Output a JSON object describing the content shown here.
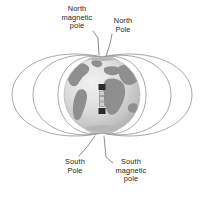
{
  "figure": {
    "background_color": "#ffffff"
  },
  "labels": {
    "north_magnetic_pole": "North\nmagnetic\npole",
    "north_pole": "North\nPole",
    "south_pole": "South\nPole",
    "south_magnetic_pole": "South\nmagnetic\npole"
  },
  "colors": {
    "text": "#1d1d1d",
    "field_line": "#9a9a9a",
    "leader_line": "#6f6f6f",
    "globe_ocean_light": "#e8e8e8",
    "globe_ocean_mid": "#cfcfcf",
    "globe_ocean_dark": "#a8a8a8",
    "globe_land": "#8f8f8f",
    "globe_outline": "#bdbdbd",
    "magnet_dark": "#2b2b2b",
    "magnet_light": "#d8d8d8"
  },
  "globe": {
    "name": "earth-globe",
    "center_x": 102,
    "center_y": 95,
    "radius": 38
  },
  "bar_magnet": {
    "name": "internal-bar-magnet",
    "center_x": 102,
    "top_y": 84,
    "bottom_y": 116,
    "segments": 5
  },
  "field_lines": {
    "name": "magnetic-field-lines",
    "loop_count": 8,
    "north_convergence": {
      "x": 102,
      "y": 57
    },
    "south_convergence": {
      "x": 102,
      "y": 133
    }
  }
}
